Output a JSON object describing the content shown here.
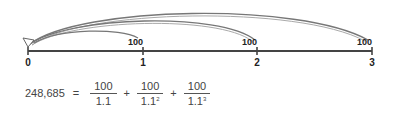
{
  "timeline": {
    "ticks": [
      {
        "label": "0",
        "x": 28
      },
      {
        "label": "1",
        "x": 143
      },
      {
        "label": "2",
        "x": 257
      },
      {
        "label": "3",
        "x": 372
      }
    ],
    "cash_flows": [
      {
        "period": "1",
        "amount": "100"
      },
      {
        "period": "2",
        "amount": "100"
      },
      {
        "period": "3",
        "amount": "100"
      }
    ],
    "colors": {
      "axis": "#444444",
      "arc": "#777777"
    }
  },
  "formula": {
    "present_value": "248,685",
    "equals": "=",
    "terms": [
      {
        "numerator": "100",
        "denominator_base": "1.1",
        "exponent": ""
      },
      {
        "numerator": "100",
        "denominator_base": "1.1",
        "exponent": "2"
      },
      {
        "numerator": "100",
        "denominator_base": "1.1",
        "exponent": "3"
      }
    ],
    "plus": "+"
  }
}
